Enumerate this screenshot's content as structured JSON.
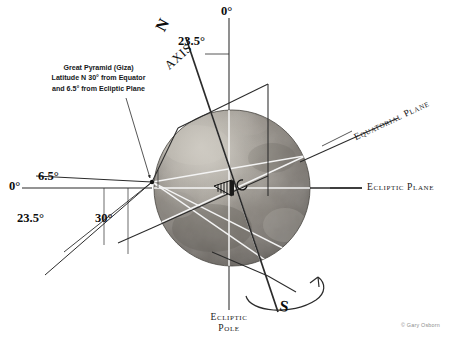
{
  "diagram": {
    "credit": "© Gary Osborn",
    "colors": {
      "line_dark": "#2b2b2b",
      "line_light": "#f2f2f2",
      "text": "#161616",
      "credit_text": "#8d8d8d",
      "background": "#ffffff"
    }
  },
  "callout": {
    "line1": "Great Pyramid (Giza)",
    "line2": "Latitude N 30° from Equator",
    "line3": "and 6.5° from Ecliptic Plane"
  },
  "labels": {
    "north_pole": "N",
    "south_pole": "S",
    "axis": "AXIS",
    "axis_tilt": "23.5°",
    "zero_top": "0°",
    "zero_left": "0°",
    "angle_6_5": "6.5°",
    "angle_23_5": "23.5°",
    "angle_30": "30°",
    "equatorial_plane": "Equatorial Plane",
    "ecliptic_plane": "Ecliptic Plane",
    "ecliptic_pole_line1": "Ecliptic",
    "ecliptic_pole_line2": "Pole"
  },
  "measurements": {
    "axial_tilt_degrees": 23.5,
    "giza_latitude_degrees": 30,
    "giza_from_ecliptic_plane_degrees": 6.5,
    "reference_degrees": 0
  }
}
